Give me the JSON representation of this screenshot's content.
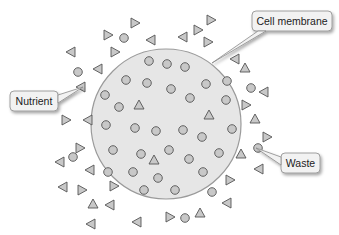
{
  "diagram": {
    "cell": {
      "cx": 166,
      "cy": 124,
      "r": 75,
      "fill": "#e6e6e6",
      "stroke": "#9a9a9a"
    },
    "colors": {
      "molecule_fill": "#c8c8c8",
      "molecule_stroke": "#555555",
      "callout_fill": "#f2f2f2",
      "callout_stroke": "#8a8a8a"
    },
    "labels": [
      {
        "id": "cell-membrane",
        "text": "Cell membrane",
        "box": [
          252,
          11,
          80,
          20
        ],
        "pointer": [
          [
            258,
            31
          ],
          [
            212,
            63
          ],
          [
            266,
            31
          ]
        ]
      },
      {
        "id": "nutrient",
        "text": "Nutrient",
        "box": [
          10,
          91,
          48,
          20
        ],
        "pointer": [
          [
            58,
            95
          ],
          [
            83,
            87
          ],
          [
            58,
            103
          ]
        ]
      },
      {
        "id": "waste",
        "text": "Waste",
        "box": [
          281,
          153,
          39,
          20
        ],
        "pointer": [
          [
            281,
            157
          ],
          [
            256,
            148
          ],
          [
            281,
            165
          ]
        ]
      }
    ],
    "inside_circles": [
      [
        149,
        61
      ],
      [
        167,
        64
      ],
      [
        185,
        67
      ],
      [
        126,
        80
      ],
      [
        147,
        83
      ],
      [
        171,
        89
      ],
      [
        206,
        84
      ],
      [
        227,
        81
      ],
      [
        105,
        95
      ],
      [
        119,
        107
      ],
      [
        190,
        98
      ],
      [
        226,
        100
      ],
      [
        106,
        125
      ],
      [
        135,
        128
      ],
      [
        156,
        131
      ],
      [
        183,
        130
      ],
      [
        202,
        137
      ],
      [
        232,
        129
      ],
      [
        113,
        150
      ],
      [
        141,
        154
      ],
      [
        169,
        150
      ],
      [
        189,
        159
      ],
      [
        219,
        153
      ],
      [
        108,
        172
      ],
      [
        133,
        172
      ],
      [
        158,
        178
      ],
      [
        203,
        172
      ],
      [
        144,
        190
      ],
      [
        175,
        190
      ]
    ],
    "inside_triangles": [
      {
        "x": 139,
        "y": 105,
        "dir": "up"
      },
      {
        "x": 209,
        "y": 115,
        "dir": "up"
      },
      {
        "x": 154,
        "y": 160,
        "dir": "up"
      }
    ],
    "outside_circles": [
      [
        78,
        72
      ],
      [
        124,
        38
      ],
      [
        251,
        88
      ],
      [
        258,
        148
      ],
      [
        212,
        192
      ],
      [
        185,
        218
      ],
      [
        73,
        157
      ]
    ],
    "outside_triangles": [
      {
        "x": 135,
        "y": 23,
        "dir": "right"
      },
      {
        "x": 108,
        "y": 35,
        "dir": "right"
      },
      {
        "x": 151,
        "y": 40,
        "dir": "left"
      },
      {
        "x": 115,
        "y": 52,
        "dir": "right"
      },
      {
        "x": 71,
        "y": 52,
        "dir": "left"
      },
      {
        "x": 98,
        "y": 69,
        "dir": "left"
      },
      {
        "x": 198,
        "y": 30,
        "dir": "right"
      },
      {
        "x": 183,
        "y": 37,
        "dir": "left"
      },
      {
        "x": 208,
        "y": 42,
        "dir": "right"
      },
      {
        "x": 211,
        "y": 20,
        "dir": "right"
      },
      {
        "x": 235,
        "y": 59,
        "dir": "left"
      },
      {
        "x": 245,
        "y": 68,
        "dir": "up"
      },
      {
        "x": 264,
        "y": 92,
        "dir": "left"
      },
      {
        "x": 246,
        "y": 105,
        "dir": "right"
      },
      {
        "x": 255,
        "y": 119,
        "dir": "up"
      },
      {
        "x": 267,
        "y": 137,
        "dir": "right"
      },
      {
        "x": 241,
        "y": 154,
        "dir": "up"
      },
      {
        "x": 259,
        "y": 169,
        "dir": "left"
      },
      {
        "x": 230,
        "y": 180,
        "dir": "right"
      },
      {
        "x": 227,
        "y": 203,
        "dir": "left"
      },
      {
        "x": 200,
        "y": 213,
        "dir": "up"
      },
      {
        "x": 170,
        "y": 217,
        "dir": "right"
      },
      {
        "x": 137,
        "y": 222,
        "dir": "left"
      },
      {
        "x": 110,
        "y": 205,
        "dir": "left"
      },
      {
        "x": 93,
        "y": 204,
        "dir": "up"
      },
      {
        "x": 82,
        "y": 190,
        "dir": "right"
      },
      {
        "x": 60,
        "y": 162,
        "dir": "left"
      },
      {
        "x": 90,
        "y": 170,
        "dir": "left"
      },
      {
        "x": 80,
        "y": 148,
        "dir": "right"
      },
      {
        "x": 88,
        "y": 120,
        "dir": "left"
      },
      {
        "x": 66,
        "y": 120,
        "dir": "right"
      },
      {
        "x": 81,
        "y": 87,
        "dir": "left"
      },
      {
        "x": 63,
        "y": 187,
        "dir": "left"
      },
      {
        "x": 114,
        "y": 186,
        "dir": "right"
      },
      {
        "x": 91,
        "y": 224,
        "dir": "left"
      }
    ]
  }
}
